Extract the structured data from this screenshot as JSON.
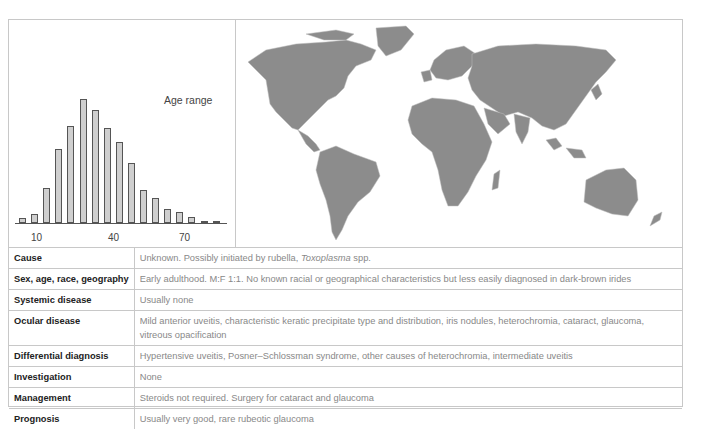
{
  "chart": {
    "title": "Age range",
    "x_ticks": [
      "10",
      "40",
      "70"
    ]
  },
  "chart_data": {
    "type": "bar",
    "title": "Age range",
    "xlabel": "",
    "ylabel": "",
    "x_tick_labels": [
      "10",
      "40",
      "70"
    ],
    "categories": [
      "5",
      "10",
      "15",
      "20",
      "25",
      "30",
      "35",
      "40",
      "45",
      "50",
      "55",
      "60",
      "65",
      "70",
      "75",
      "80",
      "85"
    ],
    "values": [
      4,
      7,
      28,
      60,
      78,
      100,
      91,
      77,
      65,
      48,
      27,
      20,
      11,
      9,
      5,
      2,
      2
    ],
    "grid": false,
    "legend": "none",
    "note": "Relative frequency; no y-axis shown"
  },
  "map": {
    "label": "world-distribution-map"
  },
  "table": {
    "rows": [
      {
        "key": "Cause",
        "value": "Unknown. Possibly initiated by rubella, ",
        "value_italic": "Toxoplasma",
        "value_suffix": " spp."
      },
      {
        "key": "Sex, age, race, geography",
        "value": "Early adulthood. M:F 1:1. No known racial or geographical characteristics but less easily diagnosed in dark-brown irides"
      },
      {
        "key": "Systemic disease",
        "value": "Usually none"
      },
      {
        "key": "Ocular disease",
        "value": "Mild anterior uveitis, characteristic keratic precipitate type and distribution, iris nodules, heterochromia, cataract, glaucoma, vitreous opacification"
      },
      {
        "key": "Differential diagnosis",
        "value": "Hypertensive uveitis, Posner–Schlossman syndrome, other causes of heterochromia, intermediate uveitis"
      },
      {
        "key": "Investigation",
        "value": "None"
      },
      {
        "key": "Management",
        "value": "Steroids not required. Surgery for cataract and glaucoma"
      },
      {
        "key": "Prognosis",
        "value": "Usually very good, rare rubeotic glaucoma"
      }
    ]
  },
  "colors": {
    "bar_fill": "#cfcfcf",
    "land": "#8c8c8c",
    "border": "#c8c8c8"
  }
}
